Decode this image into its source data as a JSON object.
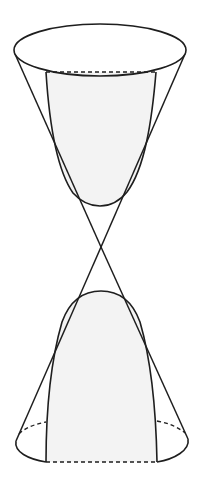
{
  "diagram": {
    "description": "Double cone cut by a plane parallel to the axis, producing a hyperbola cross-section",
    "colors": {
      "stroke": "#1e1e1e",
      "section_fill": "#f3f3f3",
      "background": "#ffffff"
    },
    "apex": [
      101,
      247
    ],
    "upper_nappe": {
      "base_ellipse": {
        "cx": 100,
        "cy": 50,
        "rx": 86,
        "ry": 27
      },
      "left_edge": [
        [
          14,
          52
        ],
        [
          101,
          247
        ]
      ],
      "right_edge": [
        [
          186,
          52
        ],
        [
          101,
          247
        ]
      ],
      "section_top_dashed": [
        [
          46,
          72
        ],
        [
          156,
          72
        ]
      ]
    },
    "lower_nappe": {
      "base_ellipse": {
        "cx": 102,
        "cy": 441,
        "rx": 86,
        "ry": 21
      },
      "left_edge": [
        [
          101,
          247
        ],
        [
          16,
          443
        ]
      ],
      "right_edge": [
        [
          101,
          247
        ],
        [
          188,
          440
        ]
      ],
      "section_bottom_dashed": [
        [
          46,
          462
        ],
        [
          157,
          462
        ]
      ]
    },
    "hyperbola": {
      "upper_vertex": [
        100,
        206
      ],
      "lower_vertex": [
        101,
        291
      ]
    }
  }
}
